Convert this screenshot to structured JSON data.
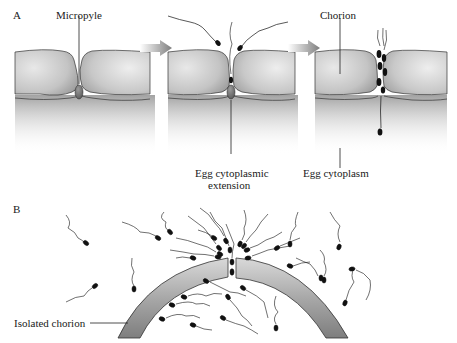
{
  "panel_a": {
    "letter": "A",
    "labels": {
      "micropyle": "Micropyle",
      "chorion": "Chorion",
      "egg_cytoplasmic_extension_line1": "Egg cytoplasmic",
      "egg_cytoplasmic_extension_line2": "extension",
      "egg_cytoplasm": "Egg cytoplasm"
    },
    "stages": [
      {
        "name": "micropyle-closed",
        "sperm_count": 0
      },
      {
        "name": "sperm-approaching",
        "sperm_count": 3
      },
      {
        "name": "sperm-entering",
        "sperm_count": 6
      }
    ],
    "arrows": 2
  },
  "panel_b": {
    "letter": "B",
    "labels": {
      "isolated_chorion": "Isolated chorion"
    }
  },
  "colors": {
    "chorion_fill": "#bdbdbd",
    "chorion_shade": "#8a8a8a",
    "cytoplasm": "#9a9a9a",
    "arrow": "#8c8c8c",
    "sperm": "#111111",
    "text": "#1a1a1a"
  }
}
